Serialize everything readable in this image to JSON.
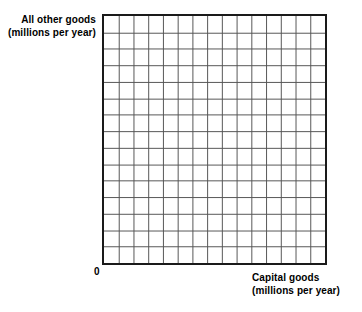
{
  "figure": {
    "background_color": "#ffffff",
    "ink_color": "#000000"
  },
  "y_axis": {
    "name": "all-other-goods-axis",
    "label_line1": "All other goods",
    "label_line2": "(millions per year)"
  },
  "x_axis": {
    "name": "capital-goods-axis",
    "label_line1": "Capital goods",
    "label_line2": "(millions per year)"
  },
  "origin": {
    "label": "0"
  },
  "chart_data": {
    "type": "scatter",
    "title": "",
    "subtitle": "",
    "xlabel": "Capital goods (millions per year)",
    "ylabel": "All other goods (millions per year)",
    "tick_labels": {
      "x": [
        "0"
      ],
      "y": []
    },
    "annotations": [
      "0"
    ],
    "legend": [],
    "legend_position": "none",
    "grid": true,
    "grid_columns": 15,
    "grid_rows": 15,
    "grid_line_color": "#555555",
    "grid_line_width": 1,
    "border_color": "#1a1a1a",
    "border_width": 2,
    "xlim": [
      0,
      15
    ],
    "ylim": [
      0,
      15
    ],
    "x": [],
    "y": [],
    "series": []
  }
}
